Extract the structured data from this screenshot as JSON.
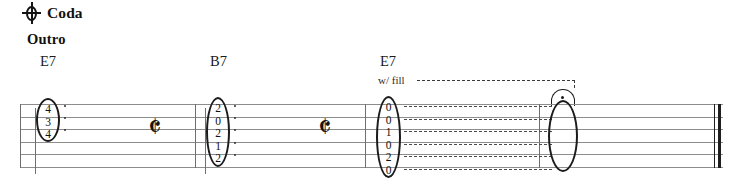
{
  "sheet": {
    "coda_symbol_name": "coda-icon",
    "coda_label": "Coda",
    "section_label": "Outro",
    "performance_note": "w/ fill",
    "fermata_symbol_name": "fermata-icon"
  },
  "chord_labels": [
    {
      "name": "E7",
      "x": 40
    },
    {
      "name": "B7",
      "x": 210
    },
    {
      "name": "E7",
      "x": 380
    }
  ],
  "staff": {
    "string_count": 6,
    "line_color": "#8d8d8d",
    "note_color": "#1b1b1b"
  },
  "measures": [
    {
      "index": 1,
      "chord": "E7",
      "tab": {
        "label": "E7-chord-voicing",
        "frets": [
          "4",
          "3",
          "4"
        ],
        "strings": [
          1,
          2,
          3
        ]
      },
      "rest": "quarter-rest"
    },
    {
      "index": 2,
      "chord": "B7",
      "tab": {
        "label": "B7-chord-voicing",
        "frets": [
          "2",
          "0",
          "2",
          "1",
          "2"
        ],
        "strings": [
          1,
          2,
          3,
          4,
          5
        ]
      },
      "rest": "quarter-rest"
    },
    {
      "index": 3,
      "chord": "E7",
      "tab": {
        "label": "E7-chord-voicing-full",
        "frets": [
          "0",
          "0",
          "1",
          "0",
          "2",
          "0"
        ],
        "strings": [
          1,
          2,
          3,
          4,
          5,
          6
        ]
      },
      "tied_to": "held-whole-note"
    }
  ],
  "rests": [
    {
      "glyph": " 𝄽",
      "x": 148,
      "y": 118
    },
    {
      "glyph": " 𝄽",
      "x": 318,
      "y": 118
    }
  ],
  "end_barline": "final-double-barline"
}
